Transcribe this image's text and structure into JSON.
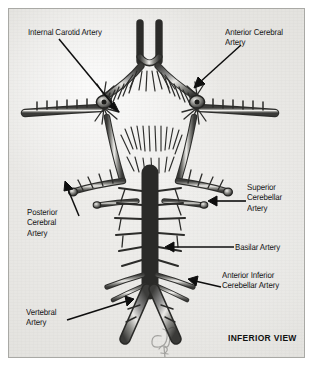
{
  "figure": {
    "view_label": "INFERIOR VIEW",
    "background_color": "#e9e8e5",
    "frame_color": "#a9a9a5",
    "ink_color": "#161616"
  },
  "labels": [
    {
      "id": "internal-carotid-artery",
      "text": "Internal Carotid Artery",
      "x": 27,
      "y": 26,
      "align": "left"
    },
    {
      "id": "anterior-cerebral-artery",
      "text": "Anterior Cerebral\nArtery",
      "x": 224,
      "y": 26,
      "align": "left"
    },
    {
      "id": "posterior-cerebral-artery",
      "text": "Posterior\nCerebral\nArtery",
      "x": 26,
      "y": 206,
      "align": "left"
    },
    {
      "id": "superior-cerebellar-artery",
      "text": "Superior\nCerebellar\nArtery",
      "x": 246,
      "y": 181,
      "align": "left"
    },
    {
      "id": "basilar-artery",
      "text": "Basilar Artery",
      "x": 234,
      "y": 241,
      "align": "left"
    },
    {
      "id": "anterior-inferior-cerebellar-artery",
      "text": "Anterior Inferior\nCerebellar Artery",
      "x": 221,
      "y": 269,
      "align": "left"
    },
    {
      "id": "vertebral-artery",
      "text": "Vertebral\nArtery",
      "x": 25,
      "y": 306,
      "align": "left"
    }
  ],
  "view": {
    "label": "INFERIOR VIEW",
    "x": 227,
    "y": 332
  },
  "leaders": [
    {
      "id": "leader-internal-carotid",
      "from": [
        62,
        40
      ],
      "to": [
        118,
        108
      ],
      "arrow": true
    },
    {
      "id": "leader-anterior-cerebral",
      "from": [
        240,
        44
      ],
      "to": [
        196,
        80
      ],
      "arrow": true
    },
    {
      "id": "leader-posterior-cerebral",
      "from": [
        72,
        212
      ],
      "to": [
        96,
        188
      ],
      "arrow": true
    },
    {
      "id": "leader-superior-cerebellar",
      "from": [
        243,
        199
      ],
      "to": [
        196,
        199
      ],
      "arrow": true
    },
    {
      "id": "leader-basilar",
      "from": [
        231,
        246
      ],
      "to": [
        166,
        246
      ],
      "arrow": true
    },
    {
      "id": "leader-aica",
      "from": [
        218,
        283
      ],
      "to": [
        188,
        288
      ],
      "arrow": true
    },
    {
      "id": "leader-vertebral",
      "from": [
        64,
        317
      ],
      "to": [
        128,
        296
      ],
      "arrow": true
    }
  ],
  "anatomy": {
    "structures": [
      "anterior-cerebral-arteries",
      "anterior-communicating-artery",
      "internal-carotid-arteries",
      "middle-cerebral-arteries",
      "posterior-communicating-arteries",
      "posterior-cerebral-arteries",
      "superior-cerebellar-arteries",
      "basilar-artery",
      "pontine-branches",
      "anterior-inferior-cerebellar-arteries",
      "vertebral-arteries"
    ]
  }
}
